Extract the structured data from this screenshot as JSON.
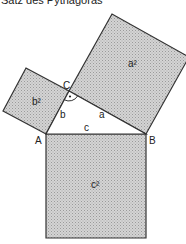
{
  "title": "Satz des Pythagoras",
  "vertices": {
    "A": "A",
    "B": "B",
    "C": "C"
  },
  "sides": {
    "a": "a",
    "b": "b",
    "c": "c"
  },
  "squares": {
    "a_sq": "a²",
    "b_sq": "b²",
    "c_sq": "c²"
  },
  "colors": {
    "square_fill": "#c9c9c9",
    "stroke": "#333333",
    "background": "#ffffff"
  },
  "right_angle_marker": "•"
}
